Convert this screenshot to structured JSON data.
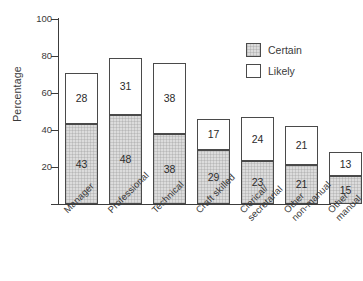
{
  "figure": {
    "clipped_title_fragment": "",
    "background_color": "#ffffff",
    "ink_color": "#3c3c3c"
  },
  "legend": {
    "position": "top-right",
    "entries": [
      {
        "label": "Certain",
        "swatch": "hatched-gray-swatch",
        "color": "#dcdcdc"
      },
      {
        "label": "Likely",
        "swatch": "white-swatch",
        "color": "#ffffff"
      }
    ]
  },
  "axes": {
    "y": {
      "label": "Percentage",
      "ticks": [
        "20",
        "40",
        "60",
        "80",
        "100"
      ],
      "tick_values": [
        20,
        40,
        60,
        80,
        100
      ],
      "min": 0,
      "max": 100
    },
    "x": {
      "label": "",
      "tick_labels": [
        {
          "line1": "Manager",
          "line2": ""
        },
        {
          "line1": "Professional",
          "line2": ""
        },
        {
          "line1": "Technical",
          "line2": ""
        },
        {
          "line1": "Craft skilled",
          "line2": ""
        },
        {
          "line1": "Clerical/",
          "line2": "secretarial"
        },
        {
          "line1": "Other",
          "line2": "non-manual"
        },
        {
          "line1": "Other",
          "line2": "manual"
        }
      ]
    }
  },
  "chart_data": {
    "type": "bar",
    "stacked": true,
    "title": "",
    "xlabel": "",
    "ylabel": "Percentage",
    "ylim": [
      0,
      100
    ],
    "grid": false,
    "legend_position": "top-right",
    "categories": [
      "Manager",
      "Professional",
      "Technical",
      "Craft skilled",
      "Clerical/ secretarial",
      "Other non-manual",
      "Other manual"
    ],
    "series": [
      {
        "name": "Certain",
        "color": "#dcdcdc",
        "values": [
          43,
          48,
          38,
          29,
          23,
          21,
          15
        ]
      },
      {
        "name": "Likely",
        "color": "#ffffff",
        "values": [
          28,
          31,
          38,
          17,
          24,
          21,
          13
        ]
      }
    ],
    "totals": [
      71,
      79,
      76,
      46,
      47,
      42,
      28
    ]
  }
}
